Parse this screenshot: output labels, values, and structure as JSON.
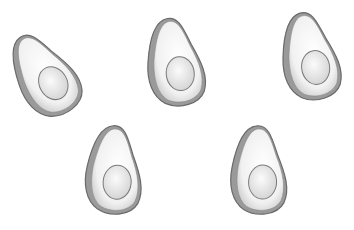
{
  "scene": {
    "description": "Five hand-drawn grayscale avocado halves with pits on a white background",
    "background": "#ffffff",
    "colors": {
      "outline": "#6e6e6e",
      "skin": "#8a8a8a",
      "flesh": "#f4f4f4",
      "pit": "#e6e6e6",
      "pit_outline": "#7a7a7a"
    },
    "avocados": [
      {
        "name": "avocado-1",
        "x": 14,
        "y": 28,
        "rotate": -28
      },
      {
        "name": "avocado-2",
        "x": 145,
        "y": 16,
        "rotate": -6
      },
      {
        "name": "avocado-3",
        "x": 280,
        "y": 10,
        "rotate": -8
      },
      {
        "name": "avocado-4",
        "x": 84,
        "y": 124,
        "rotate": 4
      },
      {
        "name": "avocado-5",
        "x": 229,
        "y": 124,
        "rotate": 2
      }
    ]
  }
}
